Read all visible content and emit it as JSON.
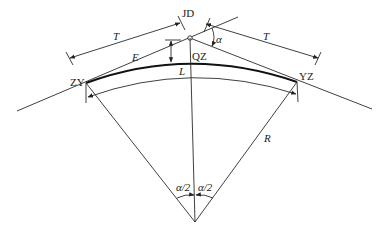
{
  "diagram": {
    "labels": {
      "jd": "JD",
      "zy": "ZY",
      "yz": "YZ",
      "qz": "QZ",
      "t_left": "T",
      "t_right": "T",
      "e": "E",
      "l": "L",
      "r": "R",
      "alpha": "α",
      "half_alpha_left": "α/2",
      "half_alpha_right": "α/2"
    },
    "points": {
      "JD": [
        190,
        38
      ],
      "ZY": [
        86,
        83
      ],
      "YZ": [
        297,
        82
      ],
      "QZ": [
        190,
        62
      ],
      "O": [
        195,
        222
      ]
    },
    "colors": {
      "line": "#2a2a2a",
      "background": "#ffffff"
    }
  }
}
